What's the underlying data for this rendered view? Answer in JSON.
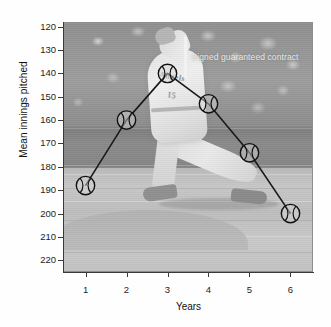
{
  "figure": {
    "background_color": "#ffffff",
    "photo_background": {
      "description_icon": "baseball-pitcher-photo",
      "base_color": "#9a9a9a",
      "jersey_text": "Angels",
      "jersey_number": "15"
    }
  },
  "axes": {
    "y_title": "Mean innings pitched",
    "x_title": "Years",
    "y_ticks": [
      "220",
      "210",
      "200",
      "190",
      "180",
      "170",
      "160",
      "150",
      "140",
      "130",
      "120"
    ],
    "x_ticks": [
      "1",
      "2",
      "3",
      "4",
      "5",
      "6"
    ]
  },
  "annotation": {
    "text": "Signed guaranteed contract",
    "marker_icon": "vertical-rule-icon",
    "color": "#e9e9e9",
    "at_x": 3
  },
  "chart_data": {
    "type": "line",
    "title": "",
    "xlabel": "Years",
    "ylabel": "Mean innings pitched",
    "x": [
      1,
      2,
      3,
      4,
      5,
      6
    ],
    "categories": [
      "1",
      "2",
      "3",
      "4",
      "5",
      "6"
    ],
    "values": [
      152,
      180,
      200,
      187,
      166,
      140
    ],
    "series": [
      {
        "name": "Mean innings pitched",
        "values": [
          152,
          180,
          200,
          187,
          166,
          140
        ],
        "marker": "baseball-icon",
        "line_color": "#1a1a1a",
        "line_width": 1.6
      }
    ],
    "xlim": [
      0.45,
      6.55
    ],
    "ylim": [
      115,
      222
    ],
    "yticks": [
      120,
      130,
      140,
      150,
      160,
      170,
      180,
      190,
      200,
      210,
      220
    ],
    "xticks": [
      1,
      2,
      3,
      4,
      5,
      6
    ],
    "grid": false,
    "legend": false,
    "legend_position": "none",
    "annotations": [
      {
        "text": "Signed guaranteed contract",
        "x": 3,
        "y": 213,
        "type": "vertical-rule-with-label"
      }
    ]
  }
}
